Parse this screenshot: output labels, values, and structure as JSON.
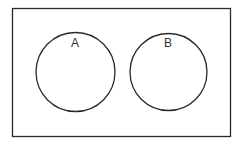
{
  "diagram": {
    "type": "venn",
    "colors": {
      "stroke": "#2a2a2a",
      "background": "#ffffff",
      "label": "#333333"
    },
    "universal_set": {
      "label": "",
      "x": 12,
      "y": 8,
      "width": 218,
      "height": 128
    },
    "sets": [
      {
        "label": "A",
        "cx": 75.5,
        "cy": 72,
        "r": 39.5,
        "label_x": 75,
        "label_y": 47
      },
      {
        "label": "B",
        "cx": 168.5,
        "cy": 72,
        "r": 38.5,
        "label_x": 168,
        "label_y": 47
      }
    ],
    "intersection": "none"
  }
}
